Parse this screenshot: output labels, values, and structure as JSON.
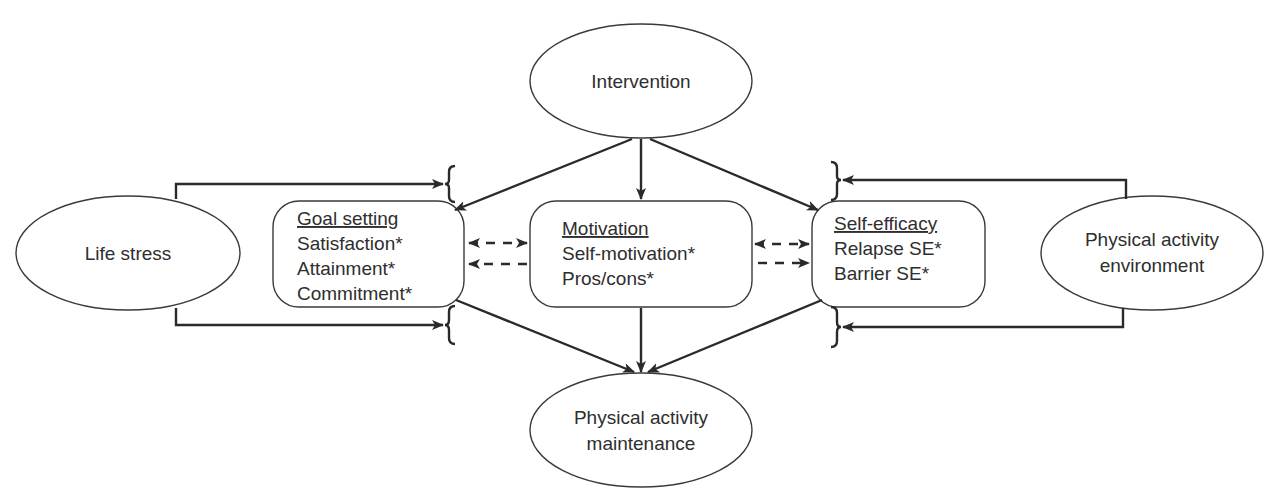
{
  "nodes": {
    "intervention": {
      "label": "Intervention"
    },
    "life_stress": {
      "label": "Life stress"
    },
    "environment": {
      "lines": [
        "Physical activity",
        "environment"
      ]
    },
    "maintenance": {
      "lines": [
        "Physical activity",
        "maintenance"
      ]
    },
    "goal_setting": {
      "title": "Goal setting",
      "items": [
        "Satisfaction*",
        "Attainment*",
        "Commitment*"
      ]
    },
    "motivation": {
      "title": "Motivation",
      "items": [
        "Self-motivation*",
        "Pros/cons*"
      ]
    },
    "self_efficacy": {
      "title": "Self-efficacy",
      "items": [
        "Relapse SE*",
        "Barrier SE*"
      ]
    }
  },
  "edges": [
    {
      "from": "Intervention",
      "to": "Goal setting",
      "style": "solid"
    },
    {
      "from": "Intervention",
      "to": "Motivation",
      "style": "solid"
    },
    {
      "from": "Intervention",
      "to": "Self-efficacy",
      "style": "solid"
    },
    {
      "from": "Goal setting",
      "to": "Physical activity maintenance",
      "style": "solid"
    },
    {
      "from": "Motivation",
      "to": "Physical activity maintenance",
      "style": "solid"
    },
    {
      "from": "Self-efficacy",
      "to": "Physical activity maintenance",
      "style": "solid"
    },
    {
      "from": "Life stress",
      "to": "Intervention→Goal setting path (moderator)",
      "style": "solid"
    },
    {
      "from": "Life stress",
      "to": "Goal setting→Maintenance path (moderator)",
      "style": "solid"
    },
    {
      "from": "Physical activity environment",
      "to": "Intervention→Self-efficacy path (moderator)",
      "style": "solid"
    },
    {
      "from": "Physical activity environment",
      "to": "Self-efficacy→Maintenance path (moderator)",
      "style": "solid"
    },
    {
      "from": "Goal setting",
      "to": "Motivation",
      "style": "dashed-bidirectional"
    },
    {
      "from": "Motivation",
      "to": "Goal setting",
      "style": "dashed"
    },
    {
      "from": "Motivation",
      "to": "Self-efficacy",
      "style": "dashed-bidirectional"
    },
    {
      "from": "Motivation",
      "to": "Self-efficacy",
      "style": "dashed"
    }
  ],
  "colors": {
    "stroke": "#2a2a2a",
    "background": "#ffffff"
  }
}
